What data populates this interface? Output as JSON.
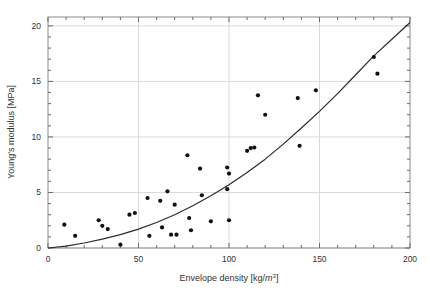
{
  "figure": {
    "background": "#ffffff",
    "frame_color": "#8a8a8a",
    "grid_color": "#d9d9d9",
    "point_color": "#111111",
    "curve_color": "#2b2b2b"
  },
  "axes": {
    "x_label_main": "Envelope density [kg/",
    "x_label_unit": "m",
    "x_label_sup": "3",
    "x_label_tail": "]",
    "x_label_full": "Envelope density [kg/m3]",
    "y_label": "Young's modulus [MPa]",
    "x_ticks": [
      "0",
      "50",
      "100",
      "150",
      "200"
    ],
    "y_ticks": [
      "0",
      "5",
      "10",
      "15",
      "20"
    ]
  },
  "chart_data": {
    "type": "scatter",
    "title": "",
    "xlabel": "Envelope density [kg/m^3]",
    "ylabel": "Young's modulus [MPa]",
    "xlim": [
      0,
      200
    ],
    "ylim": [
      0,
      20.8
    ],
    "xticks": [
      0,
      50,
      100,
      150,
      200
    ],
    "yticks": [
      0,
      5,
      10,
      15,
      20
    ],
    "grid": true,
    "legend": "none",
    "series": [
      {
        "name": "Measured samples",
        "marker": "filled-circle",
        "color": "#111111",
        "points": [
          [
            9,
            2.1
          ],
          [
            15,
            1.1
          ],
          [
            28,
            2.5
          ],
          [
            30,
            2.0
          ],
          [
            33,
            1.7
          ],
          [
            40,
            0.3
          ],
          [
            45,
            3.0
          ],
          [
            48,
            3.15
          ],
          [
            55,
            4.5
          ],
          [
            56,
            1.1
          ],
          [
            62,
            4.25
          ],
          [
            63,
            1.85
          ],
          [
            66,
            5.1
          ],
          [
            68,
            1.2
          ],
          [
            70,
            3.9
          ],
          [
            71,
            1.2
          ],
          [
            77,
            8.35
          ],
          [
            78,
            2.7
          ],
          [
            79,
            1.6
          ],
          [
            84,
            7.15
          ],
          [
            85,
            4.75
          ],
          [
            90,
            2.4
          ],
          [
            99,
            7.25
          ],
          [
            99,
            5.3
          ],
          [
            100,
            6.7
          ],
          [
            100,
            2.5
          ],
          [
            110,
            8.75
          ],
          [
            112,
            9.0
          ],
          [
            114,
            9.05
          ],
          [
            116,
            13.75
          ],
          [
            120,
            12.0
          ],
          [
            138,
            13.5
          ],
          [
            139,
            9.2
          ],
          [
            148,
            14.2
          ],
          [
            180,
            17.2
          ],
          [
            182,
            15.7
          ]
        ]
      },
      {
        "name": "Fitted power-law curve",
        "type": "line",
        "color": "#2b2b2b",
        "model": "E = 0.000415 * rho^2.05",
        "points": [
          [
            0,
            0.0
          ],
          [
            10,
            0.17
          ],
          [
            20,
            0.45
          ],
          [
            30,
            0.8
          ],
          [
            40,
            1.2
          ],
          [
            50,
            1.7
          ],
          [
            60,
            2.3
          ],
          [
            70,
            3.0
          ],
          [
            80,
            3.8
          ],
          [
            90,
            4.7
          ],
          [
            100,
            5.7
          ],
          [
            110,
            6.8
          ],
          [
            120,
            8.0
          ],
          [
            130,
            9.35
          ],
          [
            140,
            10.8
          ],
          [
            150,
            12.3
          ],
          [
            160,
            13.9
          ],
          [
            170,
            15.6
          ],
          [
            180,
            17.3
          ],
          [
            190,
            18.8
          ],
          [
            200,
            20.3
          ]
        ]
      }
    ]
  }
}
